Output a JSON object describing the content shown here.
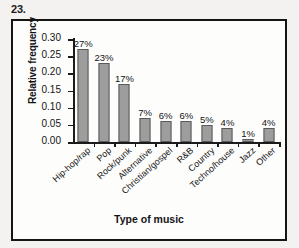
{
  "problem": {
    "number": "23."
  },
  "chart_data": {
    "type": "bar",
    "title": "",
    "xlabel": "Type of music",
    "ylabel": "Relative frequency",
    "categories": [
      "Hip-hop/rap",
      "Pop",
      "Rock/punk",
      "Alternative",
      "Christian/gospel",
      "R&B",
      "Country",
      "Techno/house",
      "Jazz",
      "Other"
    ],
    "values": [
      0.27,
      0.23,
      0.17,
      0.07,
      0.06,
      0.06,
      0.05,
      0.04,
      0.01,
      0.04
    ],
    "data_labels": [
      "27%",
      "23%",
      "17%",
      "7%",
      "6%",
      "6%",
      "5%",
      "4%",
      "1%",
      "4%"
    ],
    "ylim": [
      0.0,
      0.3
    ],
    "ytick_values": [
      0.0,
      0.05,
      0.1,
      0.15,
      0.2,
      0.25,
      0.3
    ],
    "ytick_labels": [
      "0.00",
      "0.05",
      "0.10",
      "0.15",
      "0.20",
      "0.25",
      "0.30"
    ],
    "grid": false,
    "legend": false,
    "bar_color": "#9d9d9d",
    "bar_border_color": "#5a5a5a",
    "axis_color": "#1b1b1b",
    "text_color": "#141414",
    "plot_background": "#fdfdfc",
    "page_background": "#f3f2f0"
  }
}
